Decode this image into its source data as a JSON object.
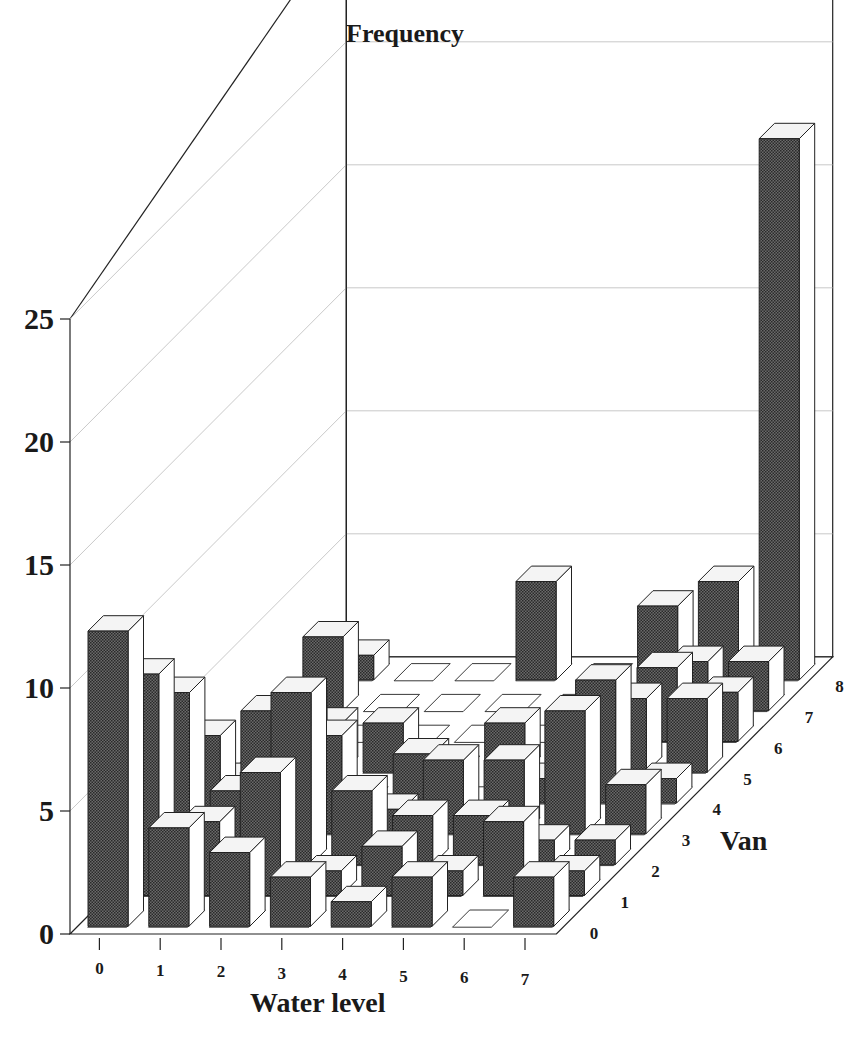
{
  "chart_data": {
    "type": "bar3d",
    "title": "Frequency",
    "xlabel": "Water level",
    "ylabel": "Van",
    "zlabel": "Frequency",
    "x_categories": [
      "0",
      "1",
      "2",
      "3",
      "4",
      "5",
      "6",
      "7"
    ],
    "y_categories": [
      "0",
      "1",
      "2",
      "3",
      "4",
      "5",
      "6",
      "7",
      "8"
    ],
    "z_ticks": [
      "0",
      "5",
      "10",
      "15",
      "20",
      "25"
    ],
    "zlim": [
      0,
      30
    ],
    "grid": true,
    "values_by_van": [
      [
        12,
        4,
        3,
        2,
        1,
        2,
        0,
        2
      ],
      [
        9,
        3,
        5,
        1,
        2,
        1,
        3,
        1
      ],
      [
        7,
        3,
        7,
        3,
        2,
        2,
        1,
        1
      ],
      [
        4,
        5,
        4,
        1,
        3,
        3,
        5,
        2
      ],
      [
        1,
        4,
        0,
        2,
        0,
        1,
        5,
        1
      ],
      [
        0,
        2,
        2,
        0,
        2,
        2,
        3,
        3
      ],
      [
        0,
        0,
        0,
        0,
        0,
        0,
        3,
        2
      ],
      [
        3,
        0,
        0,
        0,
        0,
        0,
        2,
        2
      ],
      [
        1,
        0,
        0,
        4,
        0,
        3,
        4,
        22
      ]
    ]
  },
  "labels": {
    "title": "Frequency",
    "x_axis_title": "Water level",
    "y_axis_title": "Van"
  },
  "colors": {
    "bar_front": "#555555",
    "bar_side": "#ffffff",
    "bar_top": "#f4f4f4",
    "outline": "#222222",
    "grid": "#bbbbbb"
  }
}
